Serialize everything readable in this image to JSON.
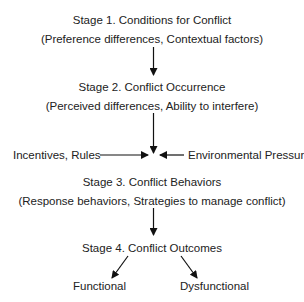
{
  "stages": [
    {
      "title": "Stage 1. Conditions for Conflict",
      "detail": "(Preference differences, Contextual factors)"
    },
    {
      "title": "Stage 2. Conflict Occurrence",
      "detail": "(Perceived differences, Ability to interfere)"
    },
    {
      "title": "Stage 3. Conflict Behaviors",
      "detail": "(Response behaviors, Strategies to manage conflict)"
    },
    {
      "title": "Stage 4. Conflict Outcomes"
    }
  ],
  "influences": {
    "left": "Incentives, Rules",
    "right": "Environmental Pressures"
  },
  "outcomes": {
    "left": "Functional",
    "right": "Dysfunctional"
  }
}
